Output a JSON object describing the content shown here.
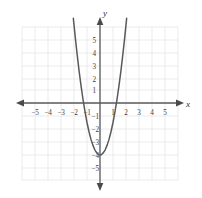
{
  "figure": {
    "kind": "cartesian-graph",
    "background_color": "#ffffff",
    "grid_color": "#e8e6e6",
    "axis_color": "#5a5a5a",
    "curve_color": "#595959",
    "label_color": "#3d3d3d"
  },
  "axes": {
    "x_axis_label": "x",
    "y_axis_label": "y",
    "x_tick_labels": [
      "−5",
      "−4",
      "−3",
      "−2",
      "−1",
      "1",
      "2",
      "3",
      "4",
      "5"
    ],
    "y_tick_labels": [
      "5",
      "4",
      "3",
      "2",
      "1",
      "−1",
      "−2",
      "−3",
      "−4",
      "−5"
    ]
  },
  "chart_data": {
    "type": "line",
    "title": "",
    "subtitle": "",
    "xlabel": "x",
    "ylabel": "y",
    "xlim": [
      -6,
      6
    ],
    "ylim": [
      -6,
      6
    ],
    "xticks": [
      -5,
      -4,
      -3,
      -2,
      -1,
      1,
      2,
      3,
      4,
      5
    ],
    "yticks": [
      5,
      4,
      3,
      2,
      1,
      -1,
      -2,
      -3,
      -4,
      -5
    ],
    "grid": true,
    "legend": false,
    "legend_position": "none",
    "annotations": [],
    "series": [
      {
        "name": "parabola",
        "shape": "upward-parabola",
        "equation": "y = 2.5x² − 4",
        "vertex": [
          0,
          -4
        ],
        "x_intercepts": [
          -1.26,
          1.26
        ],
        "y_intercept": -4,
        "x": [
          -2.05,
          -1.9,
          -1.75,
          -1.6,
          -1.45,
          -1.3,
          -1.15,
          -1.0,
          -0.85,
          -0.7,
          -0.55,
          -0.4,
          -0.25,
          -0.1,
          0,
          0.1,
          0.25,
          0.4,
          0.55,
          0.7,
          0.85,
          1.0,
          1.15,
          1.3,
          1.45,
          1.6,
          1.75,
          1.9,
          2.05
        ],
        "y": [
          6.51,
          5.03,
          3.66,
          2.4,
          1.26,
          0.23,
          -0.69,
          -1.5,
          -2.19,
          -2.78,
          -3.24,
          -3.6,
          -3.84,
          -3.98,
          -4.0,
          -3.98,
          -3.84,
          -3.6,
          -3.24,
          -2.78,
          -2.19,
          -1.5,
          -0.69,
          0.23,
          1.26,
          2.4,
          3.66,
          5.03,
          6.51
        ]
      }
    ]
  }
}
